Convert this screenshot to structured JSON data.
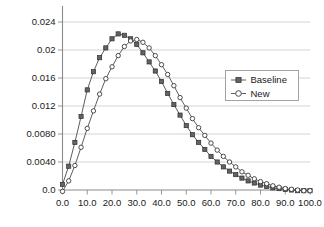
{
  "chart_data": {
    "type": "line",
    "title": "",
    "subtitle": "",
    "xlabel": "",
    "ylabel": "",
    "xlim": [
      0.0,
      100.0
    ],
    "ylim": [
      0.0,
      0.024
    ],
    "grid": true,
    "grid_axis": "y",
    "legend_position": "center-right",
    "x_tick_labels": [
      "0.0",
      "10.0",
      "20.0",
      "30.0",
      "40.0",
      "50.0",
      "60.0",
      "70.0",
      "80.0",
      "90.0",
      "100.0"
    ],
    "x_ticks": [
      0,
      10,
      20,
      30,
      40,
      50,
      60,
      70,
      80,
      90,
      100
    ],
    "y_tick_labels": [
      "0.0",
      "0.0040",
      "0.0080",
      "0.012",
      "0.016",
      "0.02",
      "0.024"
    ],
    "y_ticks": [
      0.0,
      0.004,
      0.008,
      0.012,
      0.016,
      0.02,
      0.024
    ],
    "x": [
      0,
      2.5,
      5,
      7.5,
      10,
      12.5,
      15,
      17.5,
      20,
      22.5,
      25,
      27.5,
      30,
      32.5,
      35,
      37.5,
      40,
      42.5,
      45,
      47.5,
      50,
      52.5,
      55,
      57.5,
      60,
      62.5,
      65,
      67.5,
      70,
      72.5,
      75,
      77.5,
      80,
      82.5,
      85,
      87.5,
      90,
      92.5,
      95,
      97.5,
      100
    ],
    "series": [
      {
        "name": "Baseline",
        "marker": "filled-square",
        "values": [
          0.0008,
          0.0034,
          0.0068,
          0.0105,
          0.0143,
          0.0169,
          0.0189,
          0.0203,
          0.0216,
          0.0223,
          0.0221,
          0.0216,
          0.0208,
          0.0196,
          0.0183,
          0.017,
          0.0155,
          0.0138,
          0.0122,
          0.0107,
          0.0092,
          0.0079,
          0.0068,
          0.0058,
          0.0048,
          0.004,
          0.0033,
          0.0027,
          0.0022,
          0.0017,
          0.0013,
          0.001,
          0.0007,
          0.0005,
          0.0003,
          0.0002,
          0.0001,
          0.0,
          -0.0001,
          -0.0001,
          -0.0001
        ]
      },
      {
        "name": "New",
        "marker": "open-circle",
        "values": [
          -0.0002,
          0.0013,
          0.0035,
          0.0061,
          0.0088,
          0.0113,
          0.0137,
          0.0159,
          0.0176,
          0.0192,
          0.0205,
          0.0213,
          0.0215,
          0.0211,
          0.0203,
          0.0192,
          0.0179,
          0.0165,
          0.0149,
          0.0132,
          0.0117,
          0.0102,
          0.0089,
          0.0078,
          0.0067,
          0.0057,
          0.0048,
          0.004,
          0.0033,
          0.0026,
          0.0021,
          0.0016,
          0.0012,
          0.0009,
          0.0006,
          0.0004,
          0.0002,
          0.0001,
          0.0,
          -0.0001,
          -0.0001
        ]
      }
    ],
    "legend": [
      {
        "label": "Baseline",
        "marker": "filled-square"
      },
      {
        "label": "New",
        "marker": "open-circle"
      }
    ],
    "colors": {
      "line": "#4c4c4c",
      "baseline_marker_fill": "#636363",
      "new_marker_fill": "#ffffff",
      "grid": "#c8c8c8",
      "axis": "#8a8a8a",
      "text": "#1a1a1a",
      "background": "#ffffff"
    }
  }
}
